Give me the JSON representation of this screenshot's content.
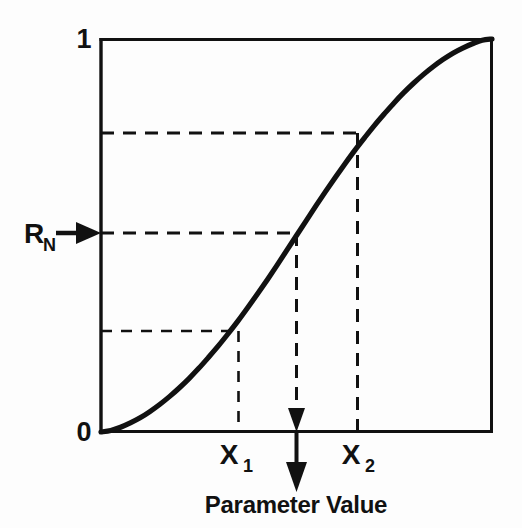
{
  "figure": {
    "kind": "cumulative-distribution-sampling-diagram",
    "background_color": "#fdfdfd",
    "ink_color": "#111111"
  },
  "axes": {
    "y_top_label": "1",
    "y_bottom_label": "0",
    "x_axis_title": "Parameter Value",
    "y_level_label": "R",
    "y_level_subscript": "N",
    "x_point_1_label": "X",
    "x_point_1_subscript": "1",
    "x_point_2_label": "X",
    "x_point_2_subscript": "2"
  },
  "annotations": {
    "level_arrow_name": "rn-input-arrow",
    "value_arrow_name": "parameter-output-arrow"
  },
  "chart_data": {
    "type": "line",
    "title": "",
    "subtitle": "",
    "xlabel": "Parameter Value",
    "ylabel": "",
    "xlim": [
      0,
      1
    ],
    "ylim": [
      0,
      1
    ],
    "grid": false,
    "legend": "none",
    "x_tick_labels": [
      "X₁",
      "X₂"
    ],
    "x_tick_values": [
      0.35,
      0.655
    ],
    "y_tick_labels": [
      "0",
      "1"
    ],
    "y_tick_values": [
      0,
      1
    ],
    "series": [
      {
        "name": "Cumulative Distribution Function",
        "x": [
          0.0,
          0.025,
          0.05,
          0.075,
          0.1,
          0.125,
          0.15,
          0.175,
          0.2,
          0.225,
          0.25,
          0.275,
          0.3,
          0.325,
          0.35,
          0.375,
          0.4,
          0.425,
          0.45,
          0.475,
          0.5,
          0.525,
          0.55,
          0.575,
          0.6,
          0.625,
          0.65,
          0.675,
          0.7,
          0.725,
          0.75,
          0.775,
          0.8,
          0.825,
          0.85,
          0.875,
          0.9,
          0.925,
          0.95,
          0.975,
          1.0
        ],
        "y": [
          0.0,
          0.004,
          0.012,
          0.023,
          0.036,
          0.052,
          0.07,
          0.09,
          0.112,
          0.136,
          0.162,
          0.19,
          0.219,
          0.25,
          0.282,
          0.316,
          0.351,
          0.387,
          0.424,
          0.462,
          0.5,
          0.538,
          0.576,
          0.613,
          0.649,
          0.684,
          0.718,
          0.75,
          0.781,
          0.81,
          0.838,
          0.864,
          0.888,
          0.91,
          0.93,
          0.948,
          0.964,
          0.977,
          0.988,
          0.997,
          1.0
        ]
      }
    ],
    "annotations": [
      {
        "name": "lower-guide",
        "y_value": 0.282,
        "x_value": 0.35,
        "label": "X₁",
        "style": "dashed-thin"
      },
      {
        "name": "rn-guide",
        "y_value": 0.5,
        "x_value": 0.5,
        "label": "R_N",
        "style": "dashed-medium"
      },
      {
        "name": "upper-guide",
        "y_value": 0.718,
        "x_value": 0.655,
        "label": "X₂",
        "style": "dashed-medium"
      }
    ]
  }
}
